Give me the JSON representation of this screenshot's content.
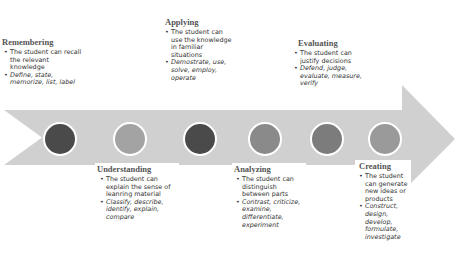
{
  "diagram": {
    "type": "timeline-arrow",
    "colors": {
      "arrow": "#d0d0d0",
      "circle_dark": "#4a4a4a",
      "circle_light": "#9e9e9e",
      "circle_mid": "#7c7c7c",
      "circle_border": "#ffffff"
    },
    "stages": [
      {
        "title": "Remembering",
        "description": "The student can recall the relevant knowledge",
        "verbs": "Define, state, memorize, list, label",
        "circle_color": "#4a4a4a"
      },
      {
        "title": "Understanding",
        "description": "The student can explain the sense of leanring material",
        "verbs": "Classify, describe, identify, explain, compare",
        "circle_color": "#a3a3a3"
      },
      {
        "title": "Applying",
        "description": "The student can use the knowledge in familiar situations",
        "verbs": "Demostrate, use, solve, employ, operate",
        "circle_color": "#4a4a4a"
      },
      {
        "title": "Analyzing",
        "description": "The student can distinguish between parts",
        "verbs": "Contrast, criticize, examine, differentiate, experiment",
        "circle_color": "#8a8a8a"
      },
      {
        "title": "Evaluating",
        "description": "The student can justify decisions",
        "verbs": "Defend, judge, evaluate, measure, verify",
        "circle_color": "#7c7c7c"
      },
      {
        "title": "Creating",
        "description": "The student can generate new ideas or products",
        "verbs": "Construct, design, develop, formulate, investigate",
        "circle_color": "#9a9a9a"
      }
    ]
  }
}
